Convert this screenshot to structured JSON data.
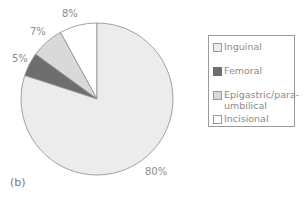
{
  "chart_data": {
    "type": "pie",
    "title": "",
    "panel_label": "(b)",
    "start_angle": "12 o'clock, counter-clockwise",
    "slices": [
      {
        "label": "Incisional",
        "value": 8,
        "display": "8%",
        "color": "#ffffff"
      },
      {
        "label": "Epigastric/para-umbilical",
        "value": 7,
        "display": "7%",
        "color": "#d9d9d9"
      },
      {
        "label": "Femoral",
        "value": 5,
        "display": "5%",
        "color": "#6e6e6e"
      },
      {
        "label": "Inguinal",
        "value": 80,
        "display": "80%",
        "color": "#ececec"
      }
    ],
    "legend": {
      "position": "right",
      "entries": [
        {
          "label": "Inguinal",
          "lines": [
            "Inguinal"
          ],
          "color": "#ececec"
        },
        {
          "label": "Femoral",
          "lines": [
            "Femoral"
          ],
          "color": "#6e6e6e"
        },
        {
          "label": "Epigastric/para-umbilical",
          "lines": [
            "Epigastric/para-",
            "umbilical"
          ],
          "color": "#d9d9d9"
        },
        {
          "label": "Incisional",
          "lines": [
            "Incisional"
          ],
          "color": "#ffffff"
        }
      ]
    }
  },
  "labels": {
    "incisional": "8%",
    "epigastric": "7%",
    "femoral": "5%",
    "inguinal": "80%"
  },
  "caption": "(b)"
}
